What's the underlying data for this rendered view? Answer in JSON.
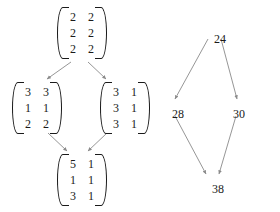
{
  "figure": {
    "background_color": "#ffffff",
    "ink_color": "#1a1a1a",
    "arrow_color": "#8a8a8a"
  },
  "left_diagram": {
    "name": "matrix-lattice",
    "node_shape": "3x2-matrix",
    "nodes": [
      {
        "id": "top",
        "label": "matrix-top",
        "rows": [
          [
            "2",
            "2"
          ],
          [
            "2",
            "2"
          ],
          [
            "2",
            "2"
          ]
        ],
        "x": 56,
        "y": 6
      },
      {
        "id": "middle-left",
        "label": "matrix-middle-left",
        "rows": [
          [
            "3",
            "3"
          ],
          [
            "1",
            "1"
          ],
          [
            "2",
            "2"
          ]
        ],
        "x": 11,
        "y": 81
      },
      {
        "id": "middle-right",
        "label": "matrix-middle-right",
        "rows": [
          [
            "3",
            "1"
          ],
          [
            "3",
            "1"
          ],
          [
            "3",
            "1"
          ]
        ],
        "x": 99,
        "y": 81
      },
      {
        "id": "bottom",
        "label": "matrix-bottom",
        "rows": [
          [
            "5",
            "1"
          ],
          [
            "1",
            "1"
          ],
          [
            "3",
            "1"
          ]
        ],
        "x": 56,
        "y": 153
      }
    ],
    "edges": [
      {
        "from": "top",
        "to": "middle-left",
        "x1": 71,
        "y1": 62,
        "x2": 47,
        "y2": 79
      },
      {
        "from": "top",
        "to": "middle-right",
        "x1": 88,
        "y1": 62,
        "x2": 106,
        "y2": 79
      },
      {
        "from": "middle-left",
        "to": "bottom",
        "x1": 48,
        "y1": 133,
        "x2": 67,
        "y2": 151
      },
      {
        "from": "middle-right",
        "to": "bottom",
        "x1": 107,
        "y1": 133,
        "x2": 88,
        "y2": 151
      }
    ]
  },
  "right_diagram": {
    "name": "number-lattice",
    "nodes": [
      {
        "id": "top",
        "value": "24",
        "x": 214,
        "y": 32
      },
      {
        "id": "middle-left",
        "value": "28",
        "x": 172,
        "y": 107
      },
      {
        "id": "middle-right",
        "value": "30",
        "x": 233,
        "y": 107
      },
      {
        "id": "bottom",
        "value": "38",
        "x": 212,
        "y": 182
      }
    ],
    "edges": [
      {
        "from": "top",
        "to": "middle-left",
        "x1": 208,
        "y1": 39,
        "x2": 175,
        "y2": 99
      },
      {
        "from": "top",
        "to": "middle-right",
        "x1": 221,
        "y1": 39,
        "x2": 237,
        "y2": 99
      },
      {
        "from": "middle-left",
        "to": "bottom",
        "x1": 175,
        "y1": 116,
        "x2": 206,
        "y2": 174
      },
      {
        "from": "middle-right",
        "to": "bottom",
        "x1": 236,
        "y1": 116,
        "x2": 219,
        "y2": 174
      }
    ]
  }
}
